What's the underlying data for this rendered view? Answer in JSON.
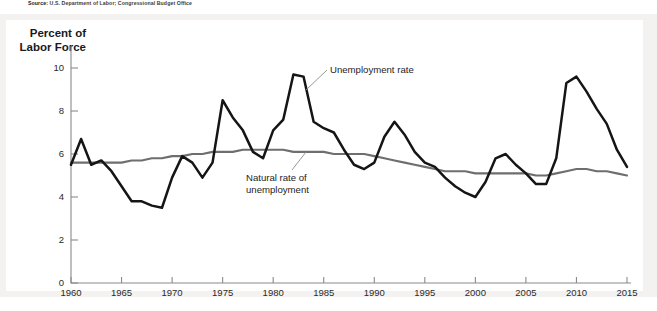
{
  "source": {
    "label": "Source:",
    "text": "U.S. Department of Labor; Congressional Budget Office"
  },
  "axis_title": "Percent of\nLabor Force",
  "annotations": {
    "unemployment": "Unemployment rate",
    "natural": "Natural rate of\nunemployment"
  },
  "colors": {
    "unemployment_line": "#151515",
    "natural_line": "#6e6e6e",
    "axis": "#8a8a8a",
    "frame": "#f3f2f0",
    "plate": "#ffffff",
    "text": "#1a1a1a"
  },
  "chart_data": {
    "type": "line",
    "title": "",
    "xlabel": "",
    "ylabel": "Percent of Labor Force",
    "xlim": [
      1960,
      2015
    ],
    "ylim": [
      0,
      11
    ],
    "yticks": [
      0,
      2,
      4,
      6,
      8,
      10
    ],
    "xticks": [
      1960,
      1965,
      1970,
      1975,
      1980,
      1985,
      1990,
      1995,
      2000,
      2005,
      2010,
      2015
    ],
    "grid": false,
    "legend": "inline-annotations",
    "x": [
      1960,
      1961,
      1962,
      1963,
      1964,
      1965,
      1966,
      1967,
      1968,
      1969,
      1970,
      1971,
      1972,
      1973,
      1974,
      1975,
      1976,
      1977,
      1978,
      1979,
      1980,
      1981,
      1982,
      1983,
      1984,
      1985,
      1986,
      1987,
      1988,
      1989,
      1990,
      1991,
      1992,
      1993,
      1994,
      1995,
      1996,
      1997,
      1998,
      1999,
      2000,
      2001,
      2002,
      2003,
      2004,
      2005,
      2006,
      2007,
      2008,
      2009,
      2010,
      2011,
      2012,
      2013,
      2014,
      2015
    ],
    "series": [
      {
        "name": "Unemployment rate",
        "color": "#151515",
        "values": [
          5.5,
          6.7,
          5.5,
          5.7,
          5.2,
          4.5,
          3.8,
          3.8,
          3.6,
          3.5,
          4.9,
          5.9,
          5.6,
          4.9,
          5.6,
          8.5,
          7.7,
          7.1,
          6.1,
          5.8,
          7.1,
          7.6,
          9.7,
          9.6,
          7.5,
          7.2,
          7.0,
          6.2,
          5.5,
          5.3,
          5.6,
          6.8,
          7.5,
          6.9,
          6.1,
          5.6,
          5.4,
          4.9,
          4.5,
          4.2,
          4.0,
          4.7,
          5.8,
          6.0,
          5.5,
          5.1,
          4.6,
          4.6,
          5.8,
          9.3,
          9.6,
          8.9,
          8.1,
          7.4,
          6.2,
          5.4
        ]
      },
      {
        "name": "Natural rate of unemployment",
        "color": "#6e6e6e",
        "values": [
          5.6,
          5.6,
          5.6,
          5.6,
          5.6,
          5.6,
          5.7,
          5.7,
          5.8,
          5.8,
          5.9,
          5.9,
          6.0,
          6.0,
          6.1,
          6.1,
          6.1,
          6.2,
          6.2,
          6.2,
          6.2,
          6.2,
          6.1,
          6.1,
          6.1,
          6.1,
          6.0,
          6.0,
          6.0,
          6.0,
          5.9,
          5.8,
          5.7,
          5.6,
          5.5,
          5.4,
          5.3,
          5.2,
          5.2,
          5.2,
          5.1,
          5.1,
          5.1,
          5.1,
          5.1,
          5.1,
          5.0,
          5.0,
          5.1,
          5.2,
          5.3,
          5.3,
          5.2,
          5.2,
          5.1,
          5.0
        ]
      }
    ]
  },
  "geometry": {
    "plot_left": 71,
    "plot_right": 627,
    "plot_top": 46,
    "plot_bottom": 283,
    "y_zero_px": 283,
    "y_ten_px": 68
  }
}
